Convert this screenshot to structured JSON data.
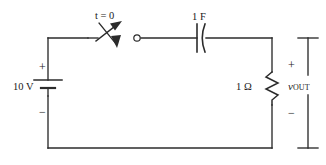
{
  "figure": {
    "kind": "schematic-diagram",
    "background_color": "#ffffff",
    "line_color": "#2b2b2b"
  },
  "labels": {
    "switch_time": "t = 0",
    "capacitor_value": "1 F",
    "source_value": "10 V",
    "resistor_value": "1 Ω",
    "source_plus": "+",
    "source_minus": "−",
    "output_plus": "+",
    "output_minus": "−",
    "output_symbol": "v",
    "output_subscript": "OUT"
  },
  "components": [
    {
      "id": "voltage-source",
      "type": "battery",
      "value": "10 V",
      "orientation": "vertical",
      "polarity_top": "+",
      "polarity_bottom": "−"
    },
    {
      "id": "switch",
      "type": "spst-switch",
      "state": "open",
      "annotation": "t = 0",
      "orientation": "horizontal"
    },
    {
      "id": "capacitor",
      "type": "capacitor",
      "value": "1 F",
      "orientation": "horizontal"
    },
    {
      "id": "resistor",
      "type": "resistor",
      "value": "1 Ω",
      "orientation": "vertical"
    },
    {
      "id": "output-port",
      "type": "terminal-pair",
      "label": "v OUT",
      "polarity_top": "+",
      "polarity_bottom": "−"
    }
  ]
}
